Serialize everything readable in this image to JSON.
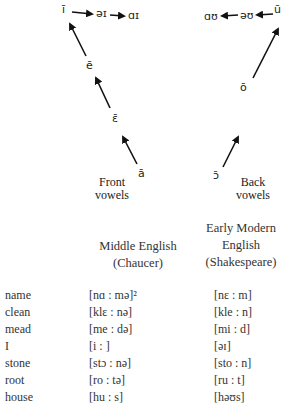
{
  "diagram": {
    "front": {
      "label_line1": "Front",
      "label_line2": "vowels",
      "nodes": {
        "a_long": "ā",
        "open_e_long": "ɛ̄",
        "e_long": "ē",
        "i_long": "ī",
        "schwa_i": "əɪ",
        "a_i": "ɑɪ"
      }
    },
    "back": {
      "label_line1": "Back",
      "label_line2": "vowels",
      "nodes": {
        "open_o_long": "ɔ̄",
        "o_long": "ō",
        "u_long": "ū",
        "schwa_u": "əʊ",
        "a_u": "ɑʊ"
      }
    }
  },
  "table": {
    "headers": {
      "middle_line1": "Middle English",
      "middle_line2": "(Chaucer)",
      "early_line1": "Early Modern",
      "early_line2": "English",
      "early_line3": "(Shakespeare)"
    },
    "rows": [
      {
        "word": "name",
        "middle": "[nɑ : mə]²",
        "early": "[nɛ : m]"
      },
      {
        "word": "clean",
        "middle": "[klɛ : nə]",
        "early": "[kle : n]"
      },
      {
        "word": "mead",
        "middle": "[me : də]",
        "early": "[mi : d]"
      },
      {
        "word": "I",
        "middle": "[i : ]",
        "early": "[əɪ]"
      },
      {
        "word": "stone",
        "middle": "[stɔ : nə]",
        "early": "[sto : n]"
      },
      {
        "word": "root",
        "middle": "[ro : tə]",
        "early": "[ru : t]"
      },
      {
        "word": "house",
        "middle": "[hu : s]",
        "early": "[həʊs]"
      }
    ]
  }
}
